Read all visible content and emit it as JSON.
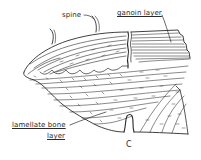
{
  "figure": {
    "labels": {
      "spine": "spine",
      "ganoin_layer": "ganoin layer",
      "lamellate_bone_line1": "lamellate bone",
      "lamellate_bone_line2": "layer",
      "notch": "C"
    },
    "colors": {
      "ink": "#2a2a2a",
      "background": "#ffffff"
    }
  }
}
